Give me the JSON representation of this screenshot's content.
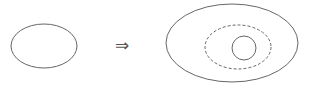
{
  "diagram": {
    "arrow_symbol": "⇒",
    "stroke_color": "#666666",
    "left": {
      "shape": "ellipse",
      "cx": 44,
      "cy": 46,
      "rx": 33,
      "ry": 22
    },
    "right": {
      "outer": {
        "shape": "ellipse",
        "cx": 232,
        "cy": 43,
        "rx": 66,
        "ry": 39,
        "style": "solid"
      },
      "middle": {
        "shape": "ellipse",
        "cx": 238,
        "cy": 47,
        "rx": 33,
        "ry": 22,
        "style": "dashed"
      },
      "inner": {
        "shape": "circle",
        "cx": 244,
        "cy": 48,
        "r": 12,
        "style": "solid"
      }
    }
  }
}
